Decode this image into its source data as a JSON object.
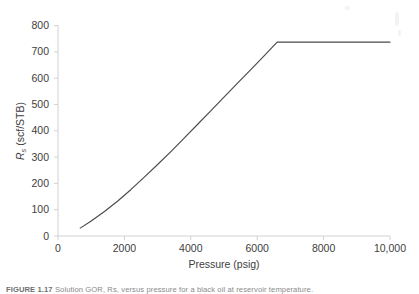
{
  "figure": {
    "caption_prefix": "FIGURE 1.17",
    "caption_text": "Solution GOR, Rs, versus pressure for a black oil at reservoir temperature."
  },
  "chart_data": {
    "type": "line",
    "title": "",
    "subtitle": "",
    "xlabel": "Pressure (psig)",
    "ylabel": "Rs (scf/STB)",
    "ylabel_base": "R",
    "ylabel_sub": "s",
    "ylabel_unit": " (scf/STB)",
    "xlim": [
      0,
      10000
    ],
    "ylim": [
      0,
      800
    ],
    "grid": false,
    "legend": null,
    "legend_position": "none",
    "xticks": [
      0,
      2000,
      4000,
      6000,
      8000,
      10000
    ],
    "xtick_labels": [
      "0",
      "2000",
      "4000",
      "6000",
      "8000",
      "10,000"
    ],
    "yticks": [
      0,
      100,
      200,
      300,
      400,
      500,
      600,
      700,
      800
    ],
    "ytick_labels": [
      "0",
      "100",
      "200",
      "300",
      "400",
      "500",
      "600",
      "700",
      "800"
    ],
    "series": [
      {
        "name": "Solution GOR",
        "color": "#4a4a4a",
        "x": [
          670,
          1000,
          1400,
          1800,
          2200,
          2600,
          3000,
          3400,
          3800,
          4200,
          4600,
          5000,
          5400,
          5800,
          6200,
          6600,
          7000,
          7600,
          8200,
          8800,
          9400,
          10000
        ],
        "y": [
          30,
          57,
          93,
          133,
          177,
          224,
          272,
          321,
          372,
          424,
          476,
          528,
          580,
          632,
          684,
          737,
          737,
          737,
          737,
          737,
          737,
          737
        ]
      }
    ],
    "annotations": {
      "bubble_point_pressure": 6600,
      "bubble_point_rs": 737,
      "plateau_value": 737,
      "start_pressure": 670,
      "start_rs": 30
    }
  }
}
